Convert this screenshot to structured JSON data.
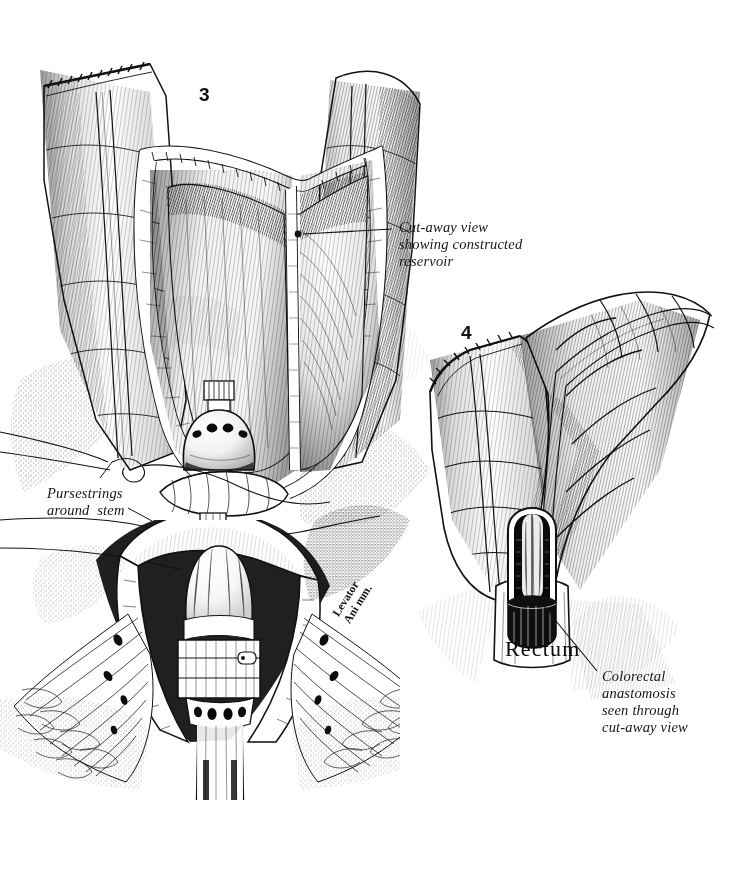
{
  "plate": {
    "title": "Colonic J-pouch reservoir and colorectal anastomosis",
    "medium": "pen-and-ink stipple and cross-hatch line drawing",
    "background_color": "#ffffff",
    "ink_color": "#111111",
    "width": 755,
    "height": 884
  },
  "figures": [
    {
      "number": "3",
      "caption_key": "cutaway_reservoir",
      "subject": "Cut-away of constructed colonic reservoir with circular stapler anvil seated in pouch, transanal stapler head and levator ani musculature"
    },
    {
      "number": "4",
      "caption_key": "colorectal_anastomosis",
      "subject": "Completed J-pouch limbs with cut-away window showing the colorectal anastomosis at the rectal stump"
    }
  ],
  "labels": {
    "cutaway_reservoir": {
      "lines": [
        "Cut-away view",
        "showing constructed",
        "reservoir"
      ],
      "text": "Cut-away view\nshowing constructed\nreservoir",
      "x": 399,
      "y": 219
    },
    "pursestrings": {
      "lines": [
        "Pursestrings",
        "around  stem"
      ],
      "text": "Pursestrings\naround  stem",
      "x": 47,
      "y": 485
    },
    "levator_ani": {
      "lines": [
        "Levator",
        "Ani mm."
      ],
      "text": "Levator\nAni mm.",
      "x": 330,
      "y": 612,
      "rotation_deg": -58
    },
    "rectum": {
      "text": "Rectum",
      "x": 505,
      "y": 636
    },
    "colorectal_anastomosis": {
      "lines": [
        "Colorectal",
        "anastomosis",
        "seen through",
        "cut-away view"
      ],
      "text": "Colorectal\nanastomosis\nseen through\ncut-away view",
      "x": 602,
      "y": 668
    }
  },
  "figure_numbers": [
    {
      "value": "3",
      "x": 199,
      "y": 84
    },
    {
      "value": "4",
      "x": 461,
      "y": 322
    }
  ],
  "leaders": [
    {
      "name": "reservoir-leader",
      "dot": [
        298,
        234
      ],
      "path": "M 303 234 L 392 229"
    },
    {
      "name": "pursestring-leader-upper",
      "path": "M 100 478 L 112 462"
    },
    {
      "name": "pursestring-leader-lower",
      "path": "M 128 508 L 150 520"
    },
    {
      "name": "anastomosis-leader",
      "path": "M 596 672 L 556 620 L 541 600"
    }
  ],
  "anatomy": {
    "reservoir_wall": "constructed colonic reservoir, cut away on the anterior face",
    "stapler_anvil": "circular stapler anvil with four staple apertures, seated at the pouch apex",
    "stem": "anvil stem passing through pouch wall, encircled by two pursestring sutures",
    "stapler_head": "transanal circular stapler cartridge within the anal canal",
    "levator_ani": "fan of levator ani muscle fibres radiating laterally",
    "staple_line": "linear staple line closing the proximal colonic end",
    "taenia": "taenia coli running along the antimesenteric border",
    "haustra": "haustral sacculations of the colonic limbs",
    "rectal_stump": "rectal stump with cut-away window exposing the anastomotic ring"
  }
}
